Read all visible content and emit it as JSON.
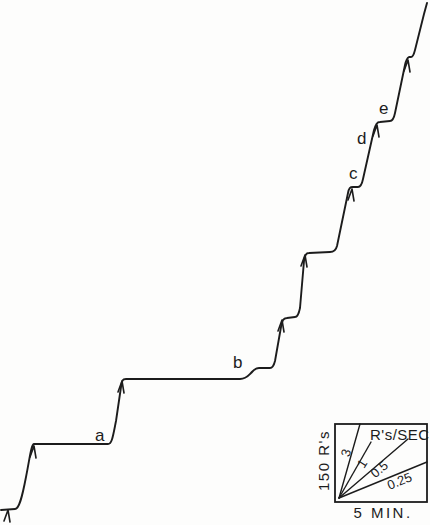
{
  "figure_background": "#fdfdfc",
  "chart_data": {
    "type": "line",
    "ink_color": "#1c1c1c",
    "axes_shown": false,
    "trace_description": "Step-shaped cumulative record rising from lower-left to upper-right; pen event arrows mark the start of each pause; plateaus get longer at the bottom and shorter toward the top",
    "trace_path": "M 1 510 L 15 509 C 19 509 22 498 26 477 C 30 457 31 445 34 444 L 108 444 C 112 444 113 436 116 421 L 121 387 C 122 381 122 379 126 379 L 240 379 C 246 379 248 376 251 373 C 254 370 255 368 259 368 L 270 368 C 273 368 274 365 275 361 L 281 327 C 282 321 283 318 287 318 L 295 317 C 298 317 299 313 300 308 L 304 261 C 305 255 306 253 309 253 L 330 252 C 334 252 336 250 337 246 L 348 193 C 349 188 350 187 353 187 L 358 187 C 361 187 362 184 363 179 L 374 130 C 376 124 377 122 380 122 L 390 121 C 393 121 394 118 395 113 L 405 65 C 406 60 407 58 409 57 L 411 57 C 413 57 414 54 415 50 L 424 14 L 427 3",
    "event_marks_px": [
      [
        8,
        510
      ],
      [
        34,
        446
      ],
      [
        122,
        381
      ],
      [
        282,
        320
      ],
      [
        305,
        255
      ],
      [
        352,
        189
      ],
      [
        377,
        125
      ],
      [
        408,
        60
      ]
    ],
    "step_labels": [
      {
        "text": "a",
        "x": 95,
        "y": 441
      },
      {
        "text": "b",
        "x": 233,
        "y": 368
      },
      {
        "text": "c",
        "x": 349,
        "y": 179
      },
      {
        "text": "d",
        "x": 357,
        "y": 144
      },
      {
        "text": "e",
        "x": 379,
        "y": 114
      }
    ],
    "scale_bars": {
      "vertical": "150 R's",
      "horizontal": "5 MIN."
    },
    "rate_legend": {
      "title": "R's/SEC",
      "box_px": [
        335,
        424,
        92,
        78
      ],
      "origin_px": [
        339,
        498
      ],
      "lines": [
        {
          "label": "3",
          "end": [
            360,
            424
          ],
          "label_x": 347,
          "label_y": 453,
          "angle": -74
        },
        {
          "label": "1",
          "end": [
            371,
            442
          ],
          "label_x": 363,
          "label_y": 464,
          "angle": -58
        },
        {
          "label": "0.5",
          "end": [
            408,
            439
          ],
          "label_x": 380,
          "label_y": 470,
          "angle": -40
        },
        {
          "label": "0.25",
          "end": [
            427,
            462
          ],
          "label_x": 400,
          "label_y": 482,
          "angle": -22
        }
      ]
    }
  }
}
